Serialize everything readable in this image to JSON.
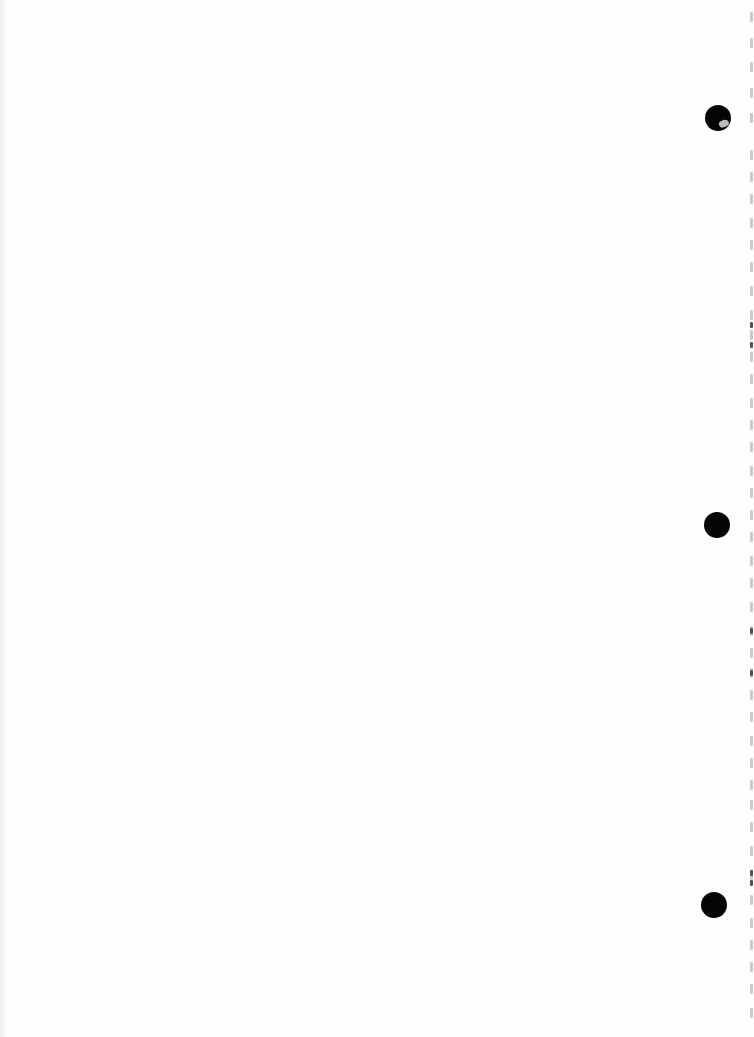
{
  "document": {
    "type": "scanned-blank-page",
    "background_color": "#fefefe",
    "text": "",
    "punch_holes": [
      {
        "cx": 718,
        "cy": 118,
        "torn": true
      },
      {
        "cx": 717,
        "cy": 525,
        "torn": false
      },
      {
        "cx": 714,
        "cy": 905,
        "torn": false
      }
    ],
    "edge_marks_y": [
      12,
      38,
      62,
      88,
      113,
      150,
      172,
      194,
      218,
      240,
      262,
      286,
      310,
      330,
      352,
      374,
      398,
      420,
      442,
      466,
      488,
      510,
      532,
      556,
      578,
      602,
      626,
      648,
      668,
      690,
      712,
      736,
      758,
      780,
      800,
      822,
      846,
      870,
      895,
      918,
      940,
      962,
      984,
      1008
    ],
    "edge_marks_dark_y": [
      322,
      342,
      628,
      670,
      870,
      880
    ]
  }
}
